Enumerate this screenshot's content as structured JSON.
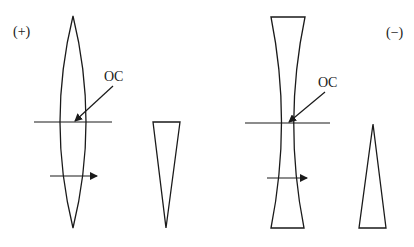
{
  "diagram": {
    "panels": [
      {
        "id": "plus-lens",
        "sign_label": "(+)",
        "lens_type": "convex",
        "optical_centre_label": "OC",
        "prism_orientation": "base-up"
      },
      {
        "id": "minus-lens",
        "sign_label": "(−)",
        "lens_type": "concave",
        "optical_centre_label": "OC",
        "prism_orientation": "base-down"
      }
    ],
    "colors": {
      "stroke": "#1a1a1a",
      "background": "#ffffff"
    }
  }
}
